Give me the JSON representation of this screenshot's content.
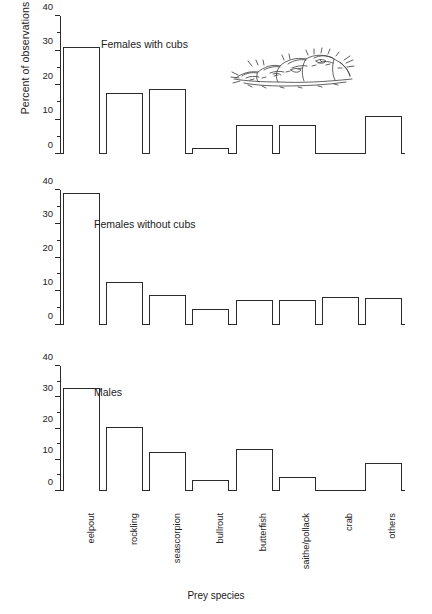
{
  "chart_data": {
    "type": "bar",
    "title": "",
    "xlabel": "Prey species",
    "ylabel": "Percent of observations",
    "ylim": [
      0,
      40
    ],
    "yticks": [
      0,
      10,
      20,
      30,
      40
    ],
    "ytick_labels": [
      "0",
      "10",
      "20",
      "30",
      "40"
    ],
    "minor_tick_step": 5,
    "grid": false,
    "legend": "none",
    "bar_style": "outlined-unfilled",
    "categories": [
      "eelpout",
      "rockling",
      "seascorpion",
      "bullrout",
      "butterfish",
      "saithe/pollack",
      "crab",
      "others"
    ],
    "panels": [
      {
        "label": "Females with cubs",
        "values": [
          31,
          17.8,
          18.8,
          1.8,
          8.5,
          8.3,
          0,
          11
        ]
      },
      {
        "label": "Females without cubs",
        "values": [
          39,
          12.8,
          8.8,
          4.6,
          7.4,
          7.3,
          8.2,
          8.0
        ]
      },
      {
        "label": "Males",
        "values": [
          33,
          20.6,
          12.6,
          3.5,
          13.4,
          4.4,
          0,
          9.1
        ]
      }
    ],
    "series": [
      {
        "name": "Females with cubs",
        "values": [
          31,
          17.8,
          18.8,
          1.8,
          8.5,
          8.3,
          0,
          11
        ]
      },
      {
        "name": "Females without cubs",
        "values": [
          39,
          12.8,
          8.8,
          4.6,
          7.4,
          7.3,
          8.2,
          8.0
        ]
      },
      {
        "name": "Males",
        "values": [
          33,
          20.6,
          12.6,
          3.5,
          13.4,
          4.4,
          0,
          9.1
        ]
      }
    ],
    "annotations": [
      {
        "name": "seal-illustration",
        "description": "line drawing of seals hauled out on rocks",
        "panel": 0
      }
    ],
    "colors": {
      "background": "#ffffff",
      "ink": "#2b2b2b",
      "text": "#222222"
    }
  }
}
